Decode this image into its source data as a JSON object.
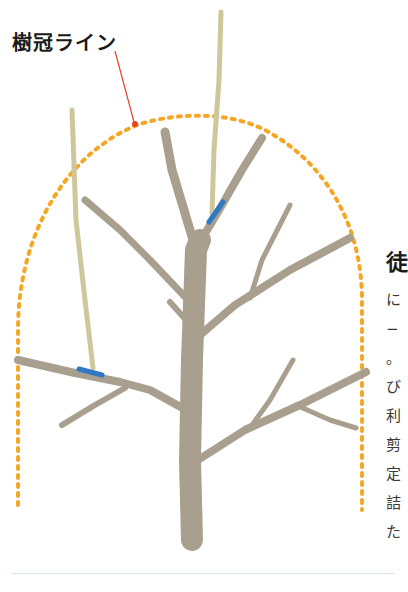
{
  "diagram": {
    "label": "樹冠ライン",
    "colors": {
      "crown_line": "#f5a623",
      "leader_line": "#e8422b",
      "branch": "#a99f8e",
      "shoot": "#cfc79c",
      "tie": "#2f78c4",
      "background": "#ffffff"
    },
    "elements": [
      {
        "name": "crown-line",
        "kind": "dotted arch",
        "description": "dotted orange canopy outline"
      },
      {
        "name": "trunk",
        "kind": "tree trunk"
      },
      {
        "name": "water-sprout-center",
        "kind": "upright shoot tied with blue tie"
      },
      {
        "name": "water-sprout-left",
        "kind": "upright shoot tied with blue tie"
      }
    ]
  },
  "side_text": {
    "heading": "徒",
    "lines": [
      "に",
      "−",
      "。",
      "び",
      "利",
      "剪",
      "定",
      "詰",
      "た"
    ]
  }
}
